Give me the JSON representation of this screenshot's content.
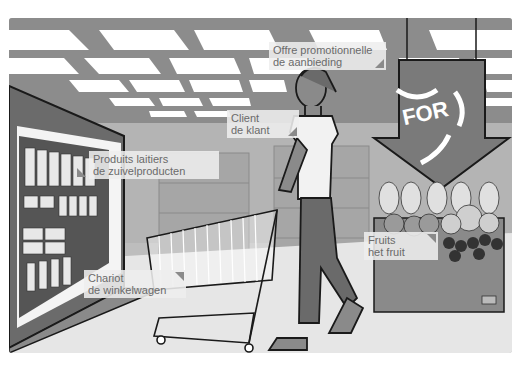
{
  "scene": {
    "description": "Supermarket vocabulary illustration",
    "sign_text": "FOR",
    "colors": {
      "ceiling_gray": "#8c8c8c",
      "light_panel": "#ffffff",
      "floor": "#e6e6e6",
      "wall": "#bdbdbd",
      "dark": "#6b6b6b",
      "outline": "#1a1a1a",
      "label_bg": "#eeeeee",
      "label_text": "#6a6a6a"
    }
  },
  "labels": [
    {
      "id": "promotion",
      "line1": "Offre promotionnelle",
      "line2": "de aanbieding"
    },
    {
      "id": "client",
      "line1": "Client",
      "line2": "de klant"
    },
    {
      "id": "dairy",
      "line1": "Produits laitiers",
      "line2": "de zuivelproducten"
    },
    {
      "id": "cart",
      "line1": "Chariot",
      "line2": "de winkelwagen"
    },
    {
      "id": "fruit",
      "line1": "Fruits",
      "line2": "het fruit"
    }
  ]
}
